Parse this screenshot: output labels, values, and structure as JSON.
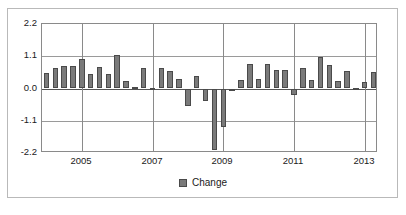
{
  "chart_data": {
    "type": "bar",
    "title": "",
    "subtitle": "",
    "xlabel": "",
    "ylabel": "",
    "ylim": [
      -2.2,
      2.2
    ],
    "yticks": [
      2.2,
      1.1,
      0.0,
      -1.1,
      -2.2
    ],
    "ytick_labels": [
      "2.2",
      "1.1",
      "0.0",
      "-1.1",
      "-2.2"
    ],
    "xtick_labels": [
      "2005",
      "2007",
      "2009",
      "2011",
      "2013"
    ],
    "xtick_positions": [
      4,
      12,
      20,
      28,
      36
    ],
    "grid": true,
    "legend": "bottom-center",
    "series": [
      {
        "name": "Change",
        "color": "#7a7a7a",
        "edge_color": "#4a4a4a",
        "values": [
          0.52,
          0.7,
          0.78,
          0.76,
          0.99,
          0.48,
          0.73,
          0.5,
          1.14,
          0.25,
          0.04,
          0.69,
          0.03,
          0.69,
          0.61,
          0.31,
          -0.6,
          0.43,
          -0.42,
          -2.1,
          -1.3,
          -0.07,
          0.28,
          0.84,
          0.33,
          0.85,
          0.63,
          0.62,
          -0.22,
          0.69,
          0.29,
          1.09,
          0.81,
          0.25,
          0.61,
          0.02,
          0.23,
          0.56
        ]
      }
    ],
    "categories": [
      "2004Q1",
      "2004Q2",
      "2004Q3",
      "2004Q4",
      "2005Q1",
      "2005Q2",
      "2005Q3",
      "2005Q4",
      "2006Q1",
      "2006Q2",
      "2006Q3",
      "2006Q4",
      "2007Q1",
      "2007Q2",
      "2007Q3",
      "2007Q4",
      "2008Q1",
      "2008Q2",
      "2008Q3",
      "2008Q4",
      "2009Q1",
      "2009Q2",
      "2009Q3",
      "2009Q4",
      "2010Q1",
      "2010Q2",
      "2010Q3",
      "2010Q4",
      "2011Q1",
      "2011Q2",
      "2011Q3",
      "2011Q4",
      "2012Q1",
      "2012Q2",
      "2012Q3",
      "2012Q4",
      "2013Q1",
      "2013Q2"
    ]
  },
  "legend": {
    "label": "Change"
  }
}
